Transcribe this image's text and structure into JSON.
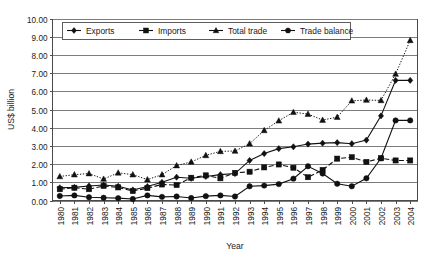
{
  "chart_data": {
    "type": "line",
    "title": "",
    "xlabel": "Year",
    "ylabel": "US$ billion",
    "grid": "horizontal",
    "legend_position": "top-inside",
    "ylim": [
      0.0,
      10.0
    ],
    "ytick_step": 1.0,
    "ytick_labels": [
      "0.00",
      "1.00",
      "2.00",
      "3.00",
      "4.00",
      "5.00",
      "6.00",
      "7.00",
      "8.00",
      "9.00",
      "10.00"
    ],
    "categories": [
      "1980",
      "1981",
      "1982",
      "1983",
      "1984",
      "1985",
      "1986",
      "1987",
      "1988",
      "1989",
      "1990",
      "1991",
      "1992",
      "1993",
      "1994",
      "1995",
      "1996",
      "1997",
      "1998",
      "1999",
      "2000",
      "2001",
      "2002",
      "2003",
      "2004"
    ],
    "series": [
      {
        "name": "Exports",
        "marker": "diamond",
        "line_style": "solid",
        "values": [
          0.7,
          0.72,
          0.8,
          0.85,
          0.78,
          0.58,
          0.77,
          1.0,
          1.28,
          1.22,
          1.32,
          1.42,
          1.48,
          2.2,
          2.58,
          2.85,
          2.95,
          3.1,
          3.15,
          3.18,
          3.12,
          3.32,
          4.65,
          6.6,
          6.6
        ]
      },
      {
        "name": "Imports",
        "marker": "square",
        "line_style": "dashed",
        "values": [
          0.62,
          0.7,
          0.62,
          0.8,
          0.72,
          0.52,
          0.68,
          0.88,
          0.85,
          1.25,
          1.38,
          1.22,
          1.52,
          1.58,
          1.82,
          1.98,
          1.8,
          1.28,
          1.68,
          2.3,
          2.38,
          2.12,
          2.32,
          2.2,
          2.2
        ]
      },
      {
        "name": "Total trade",
        "marker": "triangle",
        "line_style": "dotted",
        "values": [
          1.32,
          1.42,
          1.48,
          1.18,
          1.52,
          1.42,
          1.15,
          1.42,
          1.92,
          2.12,
          2.48,
          2.7,
          2.72,
          3.12,
          3.85,
          4.38,
          4.85,
          4.75,
          4.42,
          4.58,
          5.48,
          5.52,
          5.5,
          6.95,
          8.8
        ]
      },
      {
        "name": "Trade balance",
        "marker": "circle",
        "line_style": "solid",
        "values": [
          0.25,
          0.28,
          0.18,
          0.15,
          0.13,
          0.08,
          0.28,
          0.2,
          0.22,
          0.14,
          0.24,
          0.28,
          0.22,
          0.78,
          0.82,
          0.9,
          1.2,
          1.88,
          1.48,
          0.92,
          0.78,
          1.22,
          2.32,
          4.4,
          4.4
        ]
      }
    ]
  },
  "legend": {
    "items": [
      {
        "label": "Exports",
        "marker": "diamond"
      },
      {
        "label": "Imports",
        "marker": "square"
      },
      {
        "label": "Total trade",
        "marker": "triangle"
      },
      {
        "label": "Trade balance",
        "marker": "circle"
      }
    ]
  },
  "colors": {
    "series": "#111111",
    "grid": "#6f6f6f",
    "axis": "#4a4a4a",
    "text": "#1a1a1a",
    "background": "#ffffff"
  }
}
